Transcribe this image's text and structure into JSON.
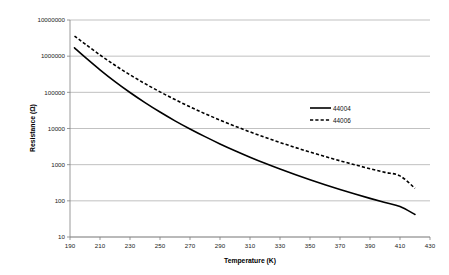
{
  "chart_data": {
    "type": "line",
    "title": "",
    "subtitle": "",
    "xlabel": "Temperature (K)",
    "ylabel": "Resistance (Ω)",
    "xlim": [
      190,
      430
    ],
    "ylim": [
      10,
      10000000
    ],
    "yscale": "log",
    "xscale": "linear",
    "grid": "horizontal",
    "legend_position": "center-right-inside",
    "xticks": [
      190,
      210,
      230,
      250,
      270,
      290,
      310,
      330,
      350,
      370,
      390,
      410,
      430
    ],
    "xtick_labels": [
      "190",
      "210",
      "230",
      "250",
      "270",
      "290",
      "310",
      "330",
      "350",
      "370",
      "390",
      "410",
      "430"
    ],
    "yticks": [
      10,
      100,
      1000,
      10000,
      100000,
      1000000,
      10000000
    ],
    "ytick_labels": [
      "10",
      "100",
      "1000",
      "10000",
      "100000",
      "1000000",
      "10000000"
    ],
    "x": [
      193,
      200,
      210,
      220,
      230,
      240,
      250,
      260,
      270,
      280,
      290,
      300,
      310,
      320,
      330,
      340,
      350,
      360,
      370,
      380,
      390,
      400,
      410,
      420
    ],
    "series": [
      {
        "name": "44004",
        "style": "solid",
        "color": "#000000",
        "values": [
          1700000,
          940000,
          420000,
          198000,
          99000,
          52000,
          28500,
          16300,
          9700,
          5950,
          3750,
          2430,
          1610,
          1090,
          755,
          532,
          381,
          277,
          205,
          154,
          117,
          90,
          70,
          42
        ]
      },
      {
        "name": "44006",
        "style": "dashed",
        "color": "#000000",
        "values": [
          3600000,
          2180000,
          1080000,
          560000,
          305000,
          174000,
          103000,
          63000,
          39700,
          25700,
          17100,
          11600,
          8050,
          5700,
          4100,
          3000,
          2230,
          1680,
          1280,
          990,
          775,
          612,
          489,
          222
        ]
      }
    ],
    "annotations": []
  },
  "legend": {
    "entries": [
      {
        "label": "44004",
        "style": "solid"
      },
      {
        "label": "44006",
        "style": "dashed"
      }
    ]
  },
  "axes": {
    "x_title": "Temperature (K)",
    "y_title": "Resistance (Ω)"
  },
  "colors": {
    "background": "#ffffff",
    "gridline": "#a6a6a6",
    "axis": "#808080",
    "series": "#000000",
    "tick_text": "#222222"
  }
}
